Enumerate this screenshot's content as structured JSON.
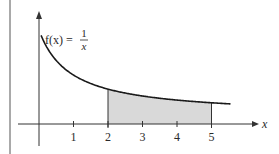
{
  "chart_data": {
    "type": "area",
    "title": "",
    "function_label": {
      "prefix": "f(x) =",
      "numerator": "1",
      "denominator": "x"
    },
    "xlabel": "x",
    "ylabel": "",
    "x_ticks": [
      "1",
      "2",
      "3",
      "4",
      "5"
    ],
    "xlim": [
      0,
      5.6
    ],
    "shaded_region": {
      "from": 2,
      "to": 5
    },
    "curve": {
      "name": "f(x) = 1/x",
      "x": [
        0.05,
        0.1,
        0.2,
        0.3,
        0.5,
        0.75,
        1,
        1.5,
        2,
        2.5,
        3,
        3.5,
        4,
        4.5,
        5,
        5.5
      ],
      "y": [
        20,
        10,
        5,
        3.33,
        2,
        1.33,
        1,
        0.67,
        0.5,
        0.4,
        0.33,
        0.29,
        0.25,
        0.22,
        0.2,
        0.18
      ]
    },
    "colors": {
      "curve": "#1a1a1a",
      "shade": "#d9d9d9",
      "axis": "#333333"
    },
    "grid": false
  }
}
